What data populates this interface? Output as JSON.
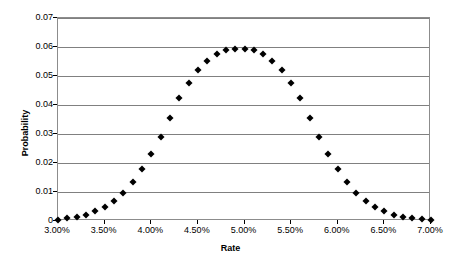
{
  "chart_data": {
    "type": "scatter",
    "title": "",
    "xlabel": "Rate",
    "ylabel": "Probability",
    "xlim": [
      3.0,
      7.0
    ],
    "ylim": [
      0,
      0.07
    ],
    "grid": true,
    "legend": false,
    "marker": "diamond",
    "marker_color": "#000000",
    "x_tick_labels": [
      "3.00%",
      "3.50%",
      "4.00%",
      "4.50%",
      "5.00%",
      "5.50%",
      "6.00%",
      "6.50%",
      "7.00%"
    ],
    "x_tick_values": [
      3.0,
      3.5,
      4.0,
      4.5,
      5.0,
      5.5,
      6.0,
      6.5,
      7.0
    ],
    "y_tick_labels": [
      "0",
      "0.01",
      "0.02",
      "0.03",
      "0.04",
      "0.05",
      "0.06",
      "0.07"
    ],
    "y_tick_values": [
      0,
      0.01,
      0.02,
      0.03,
      0.04,
      0.05,
      0.06,
      0.07
    ],
    "x": [
      3.0,
      3.1,
      3.2,
      3.3,
      3.4,
      3.5,
      3.6,
      3.7,
      3.8,
      3.9,
      4.0,
      4.1,
      4.2,
      4.3,
      4.4,
      4.5,
      4.6,
      4.7,
      4.8,
      4.9,
      5.0,
      5.1,
      5.2,
      5.3,
      5.4,
      5.5,
      5.6,
      5.7,
      5.8,
      5.9,
      6.0,
      6.1,
      6.2,
      6.3,
      6.4,
      6.5,
      6.6,
      6.7,
      6.8,
      6.9,
      7.0
    ],
    "values": [
      0.0005,
      0.0009,
      0.0014,
      0.0022,
      0.0033,
      0.0049,
      0.007,
      0.0098,
      0.0134,
      0.0178,
      0.023,
      0.029,
      0.0355,
      0.0423,
      0.0476,
      0.052,
      0.0553,
      0.0576,
      0.059,
      0.0594,
      0.0594,
      0.059,
      0.0576,
      0.0553,
      0.052,
      0.0476,
      0.0423,
      0.0355,
      0.029,
      0.023,
      0.0178,
      0.0134,
      0.0098,
      0.007,
      0.0049,
      0.0033,
      0.0022,
      0.0014,
      0.0009,
      0.0006,
      0.0004
    ]
  }
}
